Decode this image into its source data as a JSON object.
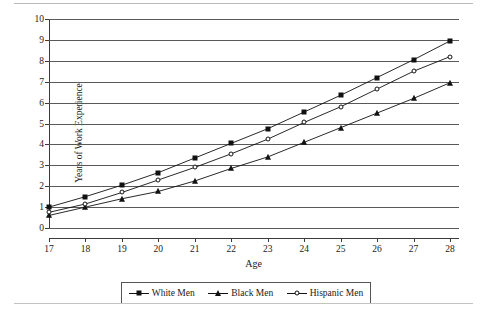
{
  "chart_data": {
    "type": "line",
    "title": "",
    "xlabel": "Age",
    "ylabel": "Years of Work Experience",
    "categories": [
      17,
      18,
      19,
      20,
      21,
      22,
      23,
      24,
      25,
      26,
      27,
      28
    ],
    "x_tick_labels": [
      "17",
      "18",
      "19",
      "20",
      "21",
      "22",
      "23",
      "24",
      "25",
      "26",
      "27",
      "28"
    ],
    "y_tick_labels": [
      "0",
      "1",
      "2",
      "3",
      "4",
      "5",
      "6",
      "7",
      "8",
      "9",
      "10"
    ],
    "xlim": [
      17,
      28
    ],
    "ylim": [
      0,
      10
    ],
    "grid": "horizontal",
    "legend_position": "bottom",
    "series": [
      {
        "name": "White Men",
        "marker": "filled-square",
        "color": "#111111",
        "values": [
          1.0,
          1.5,
          2.05,
          2.65,
          3.35,
          4.05,
          4.75,
          5.55,
          6.35,
          7.2,
          8.05,
          8.95
        ]
      },
      {
        "name": "Black Men",
        "marker": "filled-triangle",
        "color": "#111111",
        "values": [
          0.6,
          1.0,
          1.4,
          1.75,
          2.25,
          2.85,
          3.4,
          4.1,
          4.8,
          5.5,
          6.2,
          6.95
        ]
      },
      {
        "name": "Hispanic Men",
        "marker": "open-circle",
        "color": "#111111",
        "values": [
          0.75,
          1.15,
          1.7,
          2.3,
          2.9,
          3.55,
          4.25,
          5.05,
          5.8,
          6.65,
          7.5,
          8.2
        ]
      }
    ]
  },
  "legend": {
    "items": [
      {
        "label": "White Men"
      },
      {
        "label": "Black Men"
      },
      {
        "label": "Hispanic Men"
      }
    ]
  },
  "axes": {
    "x_title": "Age",
    "y_title": "Years of Work Experience"
  },
  "page": {
    "caption_remnant": ""
  }
}
